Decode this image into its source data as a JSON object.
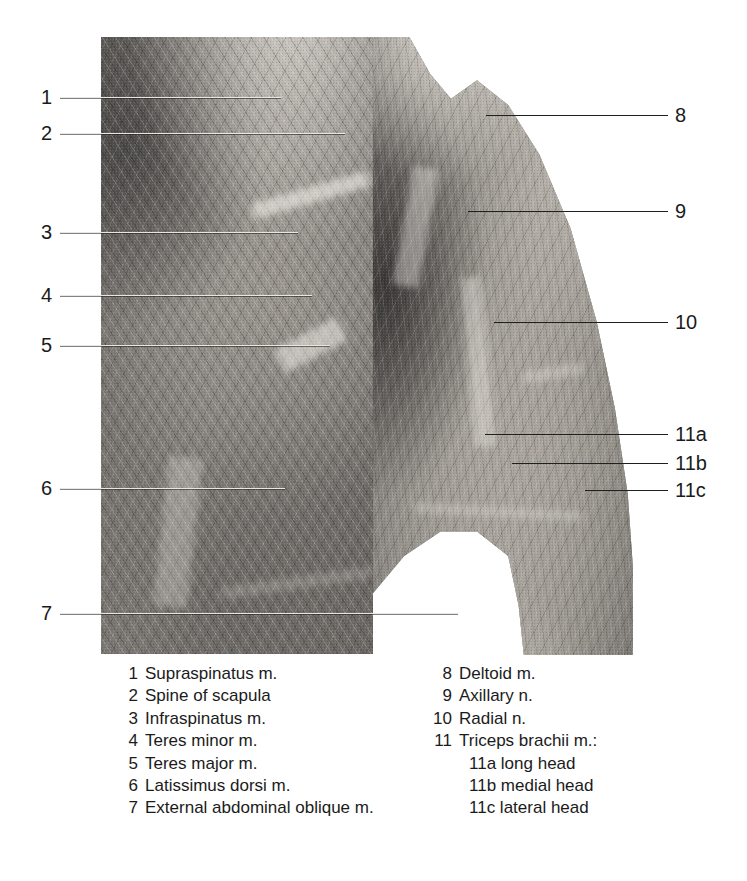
{
  "figure": {
    "kind": "anatomical-dissection-photograph"
  },
  "callouts": {
    "left": [
      {
        "number": "1",
        "y": 97,
        "line_start": 60,
        "line_end": 281
      },
      {
        "number": "2",
        "y": 133,
        "line_start": 60,
        "line_end": 345
      },
      {
        "number": "3",
        "y": 232,
        "line_start": 60,
        "line_end": 298
      },
      {
        "number": "4",
        "y": 295,
        "line_start": 60,
        "line_end": 312
      },
      {
        "number": "5",
        "y": 345,
        "line_start": 60,
        "line_end": 330
      },
      {
        "number": "6",
        "y": 488,
        "line_start": 60,
        "line_end": 285
      },
      {
        "number": "7",
        "y": 613,
        "line_start": 60,
        "line_end": 458
      }
    ],
    "right": [
      {
        "number": "8",
        "y": 115,
        "line_start": 486,
        "line_end": 668
      },
      {
        "number": "9",
        "y": 211,
        "line_start": 468,
        "line_end": 668
      },
      {
        "number": "10",
        "y": 322,
        "line_start": 494,
        "line_end": 668
      },
      {
        "number": "11a",
        "y": 434,
        "line_start": 485,
        "line_end": 668
      },
      {
        "number": "11b",
        "y": 463,
        "line_start": 512,
        "line_end": 668
      },
      {
        "number": "11c",
        "y": 490,
        "line_start": 585,
        "line_end": 668
      }
    ]
  },
  "legend": {
    "left_column": [
      {
        "number": "1",
        "label": "Supraspinatus m."
      },
      {
        "number": "2",
        "label": "Spine of scapula"
      },
      {
        "number": "3",
        "label": "Infraspinatus m."
      },
      {
        "number": "4",
        "label": "Teres minor m."
      },
      {
        "number": "5",
        "label": "Teres major m."
      },
      {
        "number": "6",
        "label": "Latissimus dorsi m."
      },
      {
        "number": "7",
        "label": "External abdominal oblique m."
      }
    ],
    "right_column": [
      {
        "number": "8",
        "label": "Deltoid m.",
        "sub": false
      },
      {
        "number": "9",
        "label": "Axillary n.",
        "sub": false
      },
      {
        "number": "10",
        "label": "Radial n.",
        "sub": false
      },
      {
        "number": "11",
        "label": "Triceps brachii m.:",
        "sub": false
      },
      {
        "number": "",
        "label": "11a long head",
        "sub": true
      },
      {
        "number": "",
        "label": "11b medial head",
        "sub": true
      },
      {
        "number": "",
        "label": "11c lateral head",
        "sub": true
      }
    ]
  },
  "colors": {
    "page_background": "#ffffff",
    "text": "#1b1b1b",
    "leader_line": "#1f1f1f",
    "photo_mid_tone": "#8d8d8d"
  }
}
